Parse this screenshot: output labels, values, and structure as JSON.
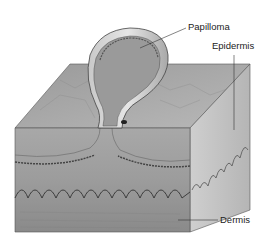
{
  "figure": {
    "labels": {
      "papilloma": "Papilloma",
      "epidermis": "Epidermis",
      "dermis": "Dermis"
    }
  }
}
